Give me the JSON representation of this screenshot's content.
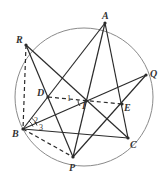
{
  "diagram": {
    "type": "geometry-circle-figure",
    "circle": {
      "cx": 84,
      "cy": 97,
      "r": 69,
      "color": "#8a8a8a"
    },
    "points": {
      "A": {
        "x": 105,
        "y": 23,
        "label": "A",
        "lx": 102,
        "ly": 19
      },
      "R": {
        "x": 26,
        "y": 45,
        "label": "R",
        "lx": 16,
        "ly": 43
      },
      "Q": {
        "x": 146,
        "y": 75,
        "label": "Q",
        "lx": 150,
        "ly": 77
      },
      "D": {
        "x": 48,
        "y": 97,
        "label": "D",
        "lx": 37,
        "ly": 96
      },
      "I": {
        "x": 86,
        "y": 101,
        "label": "I",
        "lx": 82,
        "ly": 109
      },
      "E": {
        "x": 122,
        "y": 104,
        "label": "E",
        "lx": 124,
        "ly": 111
      },
      "B": {
        "x": 23,
        "y": 129,
        "label": "B",
        "lx": 12,
        "ly": 137
      },
      "C": {
        "x": 128,
        "y": 138,
        "label": "C",
        "lx": 130,
        "ly": 148
      },
      "P": {
        "x": 73,
        "y": 157,
        "label": "P",
        "lx": 69,
        "ly": 171
      }
    },
    "segments": [
      {
        "from": "R",
        "to": "P",
        "style": "solid"
      },
      {
        "from": "R",
        "to": "C",
        "style": "solid"
      },
      {
        "from": "R",
        "to": "B",
        "style": "dashed"
      },
      {
        "from": "A",
        "to": "B",
        "style": "solid"
      },
      {
        "from": "A",
        "to": "P",
        "style": "solid"
      },
      {
        "from": "A",
        "to": "C",
        "style": "solid"
      },
      {
        "from": "B",
        "to": "Q",
        "style": "solid"
      },
      {
        "from": "B",
        "to": "C",
        "style": "solid"
      },
      {
        "from": "B",
        "to": "P",
        "style": "dashed"
      },
      {
        "from": "P",
        "to": "Q",
        "style": "solid"
      },
      {
        "from": "D",
        "to": "E",
        "style": "dashed"
      }
    ],
    "angle_labels": [
      {
        "text": "1",
        "x": 67,
        "y": 101
      },
      {
        "text": "2",
        "x": 34,
        "y": 123
      },
      {
        "text": "3",
        "x": 39,
        "y": 130
      }
    ],
    "line_color": "#2b2b2b"
  }
}
